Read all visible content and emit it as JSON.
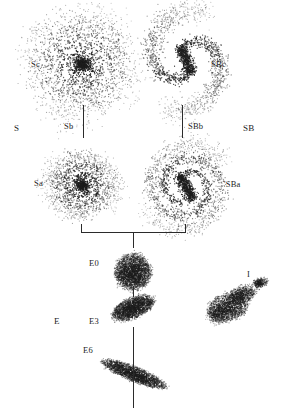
{
  "diagram": {
    "background_color": "#ffffff",
    "ink_color": "#1d1d1d",
    "labels": [
      {
        "id": "class-S",
        "text": "S",
        "x": 14,
        "y": 124,
        "size": "big"
      },
      {
        "id": "class-SB",
        "text": "SB",
        "x": 243,
        "y": 124,
        "size": "big"
      },
      {
        "id": "type-Sc",
        "text": "Sc",
        "x": 31,
        "y": 60,
        "size": "normal"
      },
      {
        "id": "type-SBc",
        "text": "SBc",
        "x": 211,
        "y": 60,
        "size": "normal"
      },
      {
        "id": "type-Sb",
        "text": "Sb",
        "x": 64,
        "y": 122,
        "size": "normal"
      },
      {
        "id": "type-SBb",
        "text": "SBb",
        "x": 188,
        "y": 122,
        "size": "normal"
      },
      {
        "id": "type-Sa",
        "text": "Sa",
        "x": 34,
        "y": 179,
        "size": "normal"
      },
      {
        "id": "type-SBa",
        "text": "'SBa",
        "x": 224,
        "y": 180,
        "size": "normal"
      },
      {
        "id": "class-E",
        "text": "E",
        "x": 54,
        "y": 317,
        "size": "big"
      },
      {
        "id": "type-E0",
        "text": "E0",
        "x": 89,
        "y": 259,
        "size": "normal"
      },
      {
        "id": "type-E3",
        "text": "E3",
        "x": 89,
        "y": 317,
        "size": "normal"
      },
      {
        "id": "type-E6",
        "text": "E6",
        "x": 83,
        "y": 346,
        "size": "normal"
      },
      {
        "id": "class-I",
        "text": "I",
        "x": 247,
        "y": 270,
        "size": "normal"
      }
    ],
    "connectors": [
      {
        "id": "stem-Sb",
        "orient": "v",
        "x": 83,
        "y": 105,
        "length": 33
      },
      {
        "id": "stem-SBb",
        "orient": "v",
        "x": 182,
        "y": 105,
        "length": 33
      },
      {
        "id": "bracket-left-arm",
        "orient": "v",
        "x": 81,
        "y": 224,
        "length": 9
      },
      {
        "id": "bracket-right-arm",
        "orient": "v",
        "x": 185,
        "y": 224,
        "length": 9
      },
      {
        "id": "bracket-cross",
        "orient": "h",
        "x": 81,
        "y": 232,
        "length": 105
      },
      {
        "id": "bracket-stem",
        "orient": "v",
        "x": 133,
        "y": 232,
        "length": 16
      },
      {
        "id": "stem-E0-E3",
        "orient": "v",
        "x": 133,
        "y": 286,
        "length": 11
      },
      {
        "id": "stem-E3-E6",
        "orient": "v",
        "x": 133,
        "y": 327,
        "length": 81
      }
    ],
    "galaxies": [
      {
        "id": "galaxy-Sc",
        "type": "spiral",
        "label": "Sc",
        "cx": 82,
        "cy": 64,
        "core_radius": 11,
        "arms": 4,
        "arm_turns": 1.05,
        "arm_reach": 46,
        "points": 2600,
        "scatter": 5.2,
        "bar": false
      },
      {
        "id": "galaxy-SBc",
        "type": "spiral",
        "label": "SBc",
        "cx": 186,
        "cy": 60,
        "core_radius": 5,
        "arms": 2,
        "arm_turns": 0.62,
        "arm_reach": 40,
        "points": 2000,
        "scatter": 4.2,
        "bar": true,
        "bar_length": 28,
        "bar_width": 5.5,
        "bar_angle": 68
      },
      {
        "id": "galaxy-Sa",
        "type": "spiral",
        "label": "Sa",
        "cx": 82,
        "cy": 185,
        "core_radius": 9,
        "arms": 2,
        "arm_turns": 1.55,
        "arm_reach": 29,
        "points": 2000,
        "scatter": 3.0,
        "bar": false
      },
      {
        "id": "galaxy-SBa",
        "type": "spiral",
        "label": "SBa",
        "cx": 186,
        "cy": 187,
        "core_radius": 4,
        "arms": 2,
        "arm_turns": 1.25,
        "arm_reach": 34,
        "points": 2200,
        "scatter": 3.2,
        "bar": true,
        "bar_length": 27,
        "bar_width": 5,
        "bar_angle": 60
      },
      {
        "id": "galaxy-E0",
        "type": "elliptical",
        "label": "E0",
        "cx": 133,
        "cy": 272,
        "rx": 18,
        "ry": 17,
        "angle": 0,
        "points": 2400,
        "ellipticity": "E0"
      },
      {
        "id": "galaxy-E3",
        "type": "elliptical",
        "label": "E3",
        "cx": 133,
        "cy": 308,
        "rx": 22,
        "ry": 10,
        "angle": -22,
        "points": 2000,
        "ellipticity": "E3"
      },
      {
        "id": "galaxy-E6",
        "type": "elliptical",
        "label": "E6",
        "cx": 134,
        "cy": 374,
        "rx": 34,
        "ry": 7,
        "angle": 22,
        "points": 2000,
        "ellipticity": "E6"
      },
      {
        "id": "galaxy-I",
        "type": "irregular",
        "label": "I",
        "cx": 233,
        "cy": 303,
        "rx": 30,
        "ry": 19,
        "angle": -14,
        "points": 2600
      }
    ]
  }
}
